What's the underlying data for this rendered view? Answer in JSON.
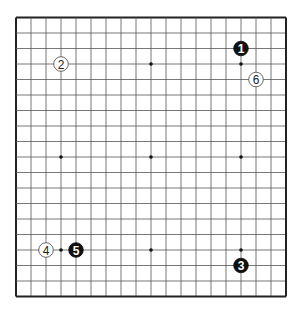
{
  "board": {
    "size": 19,
    "hoshi": [
      [
        3,
        3
      ],
      [
        9,
        3
      ],
      [
        15,
        3
      ],
      [
        3,
        9
      ],
      [
        9,
        9
      ],
      [
        15,
        9
      ],
      [
        3,
        15
      ],
      [
        9,
        15
      ],
      [
        15,
        15
      ]
    ],
    "stones": [
      {
        "move": "1",
        "color": "black",
        "col": 15,
        "row": 2
      },
      {
        "move": "2",
        "color": "white",
        "col": 3,
        "row": 3
      },
      {
        "move": "3",
        "color": "black",
        "col": 15,
        "row": 16
      },
      {
        "move": "4",
        "color": "white",
        "col": 2,
        "row": 15
      },
      {
        "move": "5",
        "color": "black",
        "col": 4,
        "row": 15
      },
      {
        "move": "6",
        "color": "white",
        "col": 16,
        "row": 4
      }
    ]
  }
}
